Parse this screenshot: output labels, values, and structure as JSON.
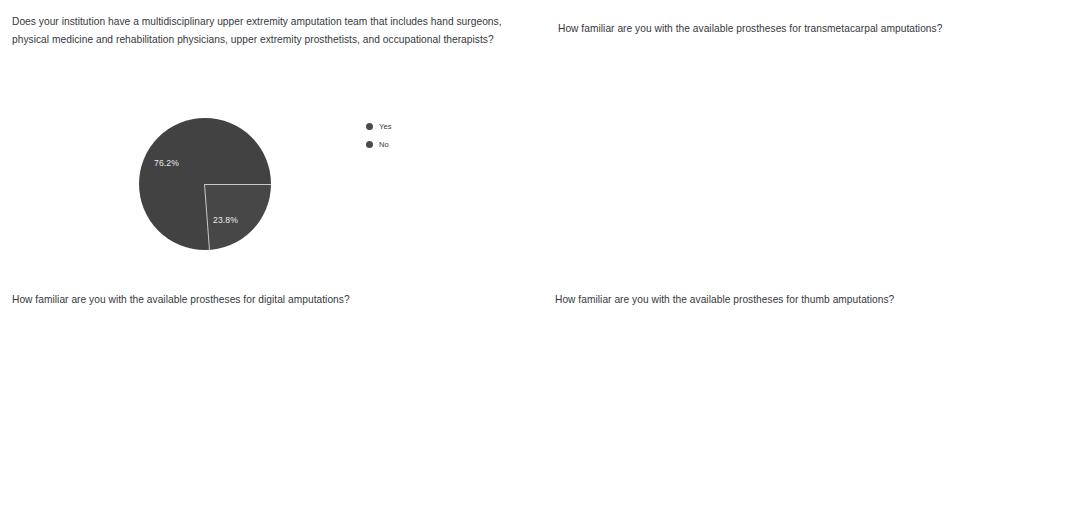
{
  "panels": {
    "top_left": {
      "question": "Does your institution have a multidisciplinary upper extremity amputation team that includes hand surgeons, physical medicine and rehabilitation physicians, upper extremity prosthetists, and occupational therapists?"
    },
    "top_right": {
      "question": "How familiar are you with the available prostheses for transmetacarpal amputations?"
    },
    "bottom_left": {
      "question": "How familiar are you with the available prostheses for digital amputations?"
    },
    "bottom_right": {
      "question": "How familiar are you with the available prostheses for thumb amputations?"
    }
  },
  "legend_labels": [
    "1 (Not Familiar)",
    "2",
    "3 (Somewhat Familiar)",
    "4",
    "5 (Very Familiar)"
  ],
  "series_colors": [
    "#4a4a4a",
    "#3d3d3d",
    "#adadad",
    "#a5a5a5",
    "#333333"
  ],
  "pie_legend": [
    "Yes",
    "No"
  ],
  "pie_slice_labels": [
    "76.2%",
    "23.8%"
  ],
  "chart_data": [
    {
      "id": "pie-multidisciplinary-team",
      "type": "pie",
      "title": "Does your institution have a multidisciplinary upper extremity amputation team that includes hand surgeons, physical medicine and rehabilitation physicians, upper extremity prosthetists, and occupational therapists?",
      "categories": [
        "Yes",
        "No"
      ],
      "values": [
        76.2,
        23.8
      ],
      "value_unit": "percent",
      "data_labels": [
        "76.2%",
        "23.8%"
      ],
      "colors": [
        "#474747",
        "#424242"
      ],
      "legend_position": "right"
    },
    {
      "id": "bar-transmetacarpal",
      "type": "bar",
      "title": "How familiar are you with the available prostheses for transmetacarpal amputations?",
      "categories": [
        "1 (Not Familiar)",
        "2",
        "3 (Somewhat Familiar)",
        "4",
        "5 (Very Familiar)"
      ],
      "values": [
        2,
        6,
        24,
        6,
        4
      ],
      "xlabel": "Degree of Familiarity",
      "ylabel": "",
      "ylim": [
        0,
        24
      ],
      "yticks": [
        0,
        10,
        20
      ],
      "grid": true,
      "legend_position": "top"
    },
    {
      "id": "bar-digital",
      "type": "bar",
      "title": "How familiar are you with the available prostheses for digital amputations?",
      "categories": [
        "1 (Not Familiar)",
        "2",
        "3 (Somewhat Familiar)",
        "4",
        "5 (Very Familiar)"
      ],
      "values": [
        1,
        2,
        23,
        8,
        7
      ],
      "xlabel": "Degree of Familiarity",
      "ylabel": "",
      "ylim": [
        0,
        23
      ],
      "yticks": [
        0,
        10,
        20
      ],
      "grid": true,
      "legend_position": "top"
    },
    {
      "id": "bar-thumb",
      "type": "bar",
      "title": "How familiar are you with the available prostheses for thumb amputations?",
      "categories": [
        "1 (Not Familiar)",
        "2",
        "3 (Somewhat Familiar)",
        "4",
        "5 (Very Familiar)"
      ],
      "values": [
        3,
        6,
        20,
        7,
        6
      ],
      "xlabel": "Degree of Familiarity",
      "ylabel": "",
      "ylim": [
        0,
        20
      ],
      "yticks": [
        0,
        5,
        10,
        15,
        20
      ],
      "grid": true,
      "legend_position": "top"
    }
  ]
}
